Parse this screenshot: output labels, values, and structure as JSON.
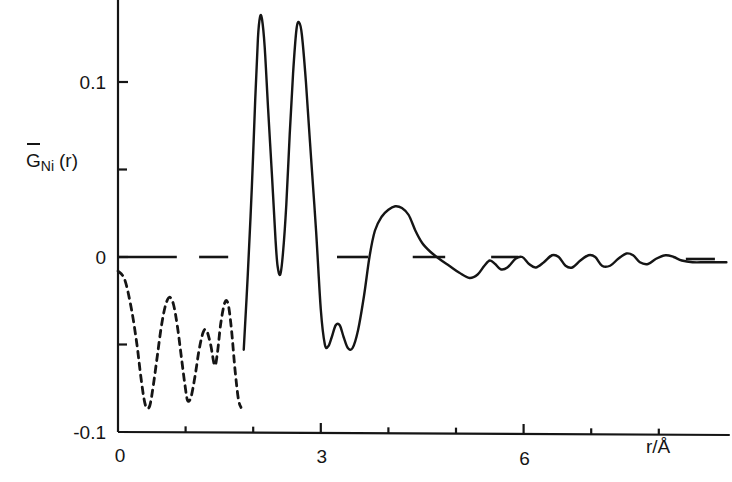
{
  "figure": {
    "kind": "scientific-line-plot",
    "background": "#ffffff",
    "ink": "#151515"
  },
  "labels": {
    "y_axis_label_main": "G",
    "y_axis_label_overbar": "‾",
    "y_axis_label_subscript": "Ni",
    "y_axis_label_arg": "(r)",
    "y_axis_label_full": "G̅Ni (r)",
    "x_axis_label": "r/Å",
    "y_ticks_labeled": [
      "0.1",
      "0",
      "-0.1"
    ],
    "x_ticks_labeled": [
      "0",
      "3",
      "6"
    ]
  },
  "chart_data": {
    "type": "line",
    "title": "",
    "xlabel": "r/Å",
    "ylabel": "G̅_Ni (r)",
    "xlim": [
      0,
      9.0
    ],
    "ylim": [
      -0.1,
      0.145
    ],
    "grid": false,
    "legend": "none",
    "x_ticks_major": [
      0,
      3,
      6
    ],
    "x_ticks_all": [
      0,
      1,
      2,
      3,
      4,
      5,
      6,
      7,
      8
    ],
    "y_ticks_major": [
      -0.1,
      0,
      0.1
    ],
    "y_ticks_minor": [
      0.05
    ],
    "zero_line_style": "dashed-segments",
    "zero_line_segments_r": [
      [
        0.0,
        0.87
      ],
      [
        1.2,
        1.63
      ],
      [
        3.24,
        3.7
      ],
      [
        4.36,
        4.84
      ],
      [
        5.52,
        5.92
      ],
      [
        8.4,
        8.83
      ]
    ],
    "series": [
      {
        "name": "unphysical small-r ripple",
        "style": "dashed",
        "r_range": [
          0.0,
          1.82
        ],
        "points": [
          [
            0.0,
            -0.008
          ],
          [
            0.1,
            -0.013
          ],
          [
            0.2,
            -0.03
          ],
          [
            0.28,
            -0.05
          ],
          [
            0.33,
            -0.066
          ],
          [
            0.38,
            -0.08
          ],
          [
            0.42,
            -0.086
          ],
          [
            0.47,
            -0.085
          ],
          [
            0.52,
            -0.074
          ],
          [
            0.58,
            -0.057
          ],
          [
            0.64,
            -0.04
          ],
          [
            0.7,
            -0.028
          ],
          [
            0.76,
            -0.023
          ],
          [
            0.82,
            -0.027
          ],
          [
            0.88,
            -0.04
          ],
          [
            0.94,
            -0.058
          ],
          [
            0.99,
            -0.073
          ],
          [
            1.03,
            -0.082
          ],
          [
            1.08,
            -0.08
          ],
          [
            1.14,
            -0.068
          ],
          [
            1.2,
            -0.053
          ],
          [
            1.26,
            -0.043
          ],
          [
            1.31,
            -0.042
          ],
          [
            1.37,
            -0.05
          ],
          [
            1.43,
            -0.062
          ],
          [
            1.47,
            -0.055
          ],
          [
            1.52,
            -0.038
          ],
          [
            1.58,
            -0.026
          ],
          [
            1.63,
            -0.027
          ],
          [
            1.68,
            -0.042
          ],
          [
            1.73,
            -0.064
          ],
          [
            1.78,
            -0.081
          ],
          [
            1.82,
            -0.086
          ]
        ]
      },
      {
        "name": "G_Ni(r)",
        "style": "solid",
        "r_range": [
          1.86,
          9.0
        ],
        "points": [
          [
            1.86,
            -0.053
          ],
          [
            1.92,
            -0.01
          ],
          [
            1.98,
            0.04
          ],
          [
            2.03,
            0.09
          ],
          [
            2.07,
            0.125
          ],
          [
            2.1,
            0.137
          ],
          [
            2.13,
            0.136
          ],
          [
            2.17,
            0.12
          ],
          [
            2.22,
            0.085
          ],
          [
            2.28,
            0.045
          ],
          [
            2.33,
            0.01
          ],
          [
            2.36,
            -0.005
          ],
          [
            2.4,
            -0.01
          ],
          [
            2.44,
            0.002
          ],
          [
            2.49,
            0.03
          ],
          [
            2.54,
            0.07
          ],
          [
            2.59,
            0.105
          ],
          [
            2.64,
            0.13
          ],
          [
            2.68,
            0.134
          ],
          [
            2.72,
            0.127
          ],
          [
            2.78,
            0.1
          ],
          [
            2.85,
            0.06
          ],
          [
            2.93,
            0.015
          ],
          [
            3.0,
            -0.03
          ],
          [
            3.06,
            -0.05
          ],
          [
            3.11,
            -0.051
          ],
          [
            3.16,
            -0.046
          ],
          [
            3.22,
            -0.039
          ],
          [
            3.28,
            -0.039
          ],
          [
            3.34,
            -0.046
          ],
          [
            3.4,
            -0.052
          ],
          [
            3.47,
            -0.052
          ],
          [
            3.55,
            -0.042
          ],
          [
            3.64,
            -0.022
          ],
          [
            3.72,
            0.0
          ],
          [
            3.8,
            0.015
          ],
          [
            3.9,
            0.023
          ],
          [
            4.0,
            0.027
          ],
          [
            4.1,
            0.029
          ],
          [
            4.2,
            0.028
          ],
          [
            4.3,
            0.024
          ],
          [
            4.4,
            0.015
          ],
          [
            4.5,
            0.008
          ],
          [
            4.62,
            0.003
          ],
          [
            4.75,
            -0.001
          ],
          [
            4.9,
            -0.005
          ],
          [
            5.05,
            -0.009
          ],
          [
            5.2,
            -0.012
          ],
          [
            5.32,
            -0.01
          ],
          [
            5.42,
            -0.005
          ],
          [
            5.5,
            -0.002
          ],
          [
            5.58,
            -0.004
          ],
          [
            5.66,
            -0.007
          ],
          [
            5.76,
            -0.006
          ],
          [
            5.88,
            -0.001
          ],
          [
            5.98,
            0.0
          ],
          [
            6.08,
            -0.004
          ],
          [
            6.18,
            -0.006
          ],
          [
            6.3,
            -0.003
          ],
          [
            6.42,
            0.001
          ],
          [
            6.52,
            0.0
          ],
          [
            6.62,
            -0.005
          ],
          [
            6.72,
            -0.006
          ],
          [
            6.84,
            -0.002
          ],
          [
            6.96,
            0.001
          ],
          [
            7.06,
            0.0
          ],
          [
            7.16,
            -0.005
          ],
          [
            7.28,
            -0.005
          ],
          [
            7.4,
            -0.001
          ],
          [
            7.52,
            0.002
          ],
          [
            7.62,
            0.001
          ],
          [
            7.72,
            -0.003
          ],
          [
            7.84,
            -0.004
          ],
          [
            7.96,
            -0.001
          ],
          [
            8.1,
            0.001
          ],
          [
            8.22,
            0.0
          ],
          [
            8.34,
            -0.002
          ],
          [
            8.5,
            -0.003
          ],
          [
            8.7,
            -0.003
          ],
          [
            9.0,
            -0.003
          ]
        ]
      }
    ]
  }
}
